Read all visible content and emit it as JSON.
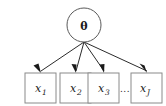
{
  "diagram": {
    "type": "directed-graphical-model",
    "background_color": "#ffffff",
    "latent_node": {
      "id": "theta",
      "shape": "circle",
      "label": "θ",
      "cx": 84,
      "cy": 25,
      "r": 17,
      "stroke_color": "#5a5a5a",
      "fill_color": "#ffffff"
    },
    "fan_origin": {
      "x": 84,
      "y": 42
    },
    "observed_nodes": [
      {
        "id": "x1",
        "shape": "square",
        "base": "x",
        "subscript": "1",
        "x": 25,
        "y": 73,
        "width": 31,
        "height": 30,
        "stroke_color": "#8a8a8a",
        "fill_color": "#ffffff"
      },
      {
        "id": "x2",
        "shape": "square",
        "base": "x",
        "subscript": "2",
        "x": 60,
        "y": 73,
        "width": 31,
        "height": 30,
        "stroke_color": "#8a8a8a",
        "fill_color": "#ffffff"
      },
      {
        "id": "x3",
        "shape": "square",
        "base": "x",
        "subscript": "3",
        "x": 88,
        "y": 73,
        "width": 31,
        "height": 30,
        "stroke_color": "#8a8a8a",
        "fill_color": "#ffffff"
      },
      {
        "id": "xJ",
        "shape": "square",
        "base": "x",
        "subscript": "J",
        "x": 131,
        "y": 73,
        "width": 31,
        "height": 30,
        "stroke_color": "#8a8a8a",
        "fill_color": "#ffffff"
      }
    ],
    "ellipsis": {
      "label": "...",
      "x": 125,
      "y": 91
    },
    "edges": [
      {
        "id": "theta-to-x1",
        "from": "theta",
        "to": "x1",
        "x1": 84,
        "y1": 42,
        "x2": 41,
        "y2": 71
      },
      {
        "id": "theta-to-x2",
        "from": "theta",
        "to": "x2",
        "x1": 84,
        "y1": 42,
        "x2": 76,
        "y2": 71
      },
      {
        "id": "theta-to-x3",
        "from": "theta",
        "to": "x3",
        "x1": 84,
        "y1": 42,
        "x2": 104,
        "y2": 71
      },
      {
        "id": "theta-to-xJ",
        "from": "theta",
        "to": "xJ",
        "x1": 84,
        "y1": 42,
        "x2": 147,
        "y2": 71
      }
    ],
    "edge_color": "#2b2b2b",
    "arrowhead_color": "#1a1a1a"
  }
}
